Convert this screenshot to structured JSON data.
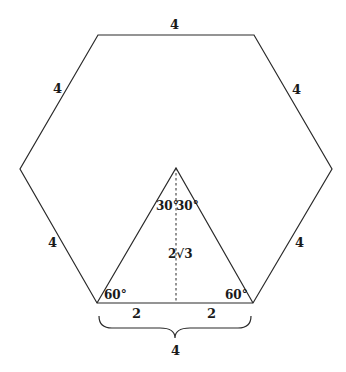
{
  "diagram": {
    "title": "",
    "shape": "regular hexagon with inscribed equilateral triangle",
    "hexagon": {
      "vertices": [
        [
          98,
          35
        ],
        [
          254,
          35
        ],
        [
          332,
          169
        ],
        [
          253,
          303
        ],
        [
          97,
          303
        ],
        [
          20,
          169
        ]
      ],
      "side_labels": [
        {
          "text": "4",
          "x": 174,
          "y": 29
        },
        {
          "text": "4",
          "x": 57,
          "y": 93
        },
        {
          "text": "4",
          "x": 296,
          "y": 94
        },
        {
          "text": "4",
          "x": 52,
          "y": 247
        },
        {
          "text": "4",
          "x": 299,
          "y": 247
        }
      ]
    },
    "triangle": {
      "vertices": [
        [
          176,
          168
        ],
        [
          97,
          303
        ],
        [
          253,
          303
        ]
      ],
      "apex_angles": [
        {
          "text": "30°",
          "x": 157,
          "y": 210
        },
        {
          "text": "30°",
          "x": 177,
          "y": 210
        }
      ],
      "base_angles": [
        {
          "text": "60°",
          "x": 104,
          "y": 299
        },
        {
          "text": "60°",
          "x": 226,
          "y": 299
        }
      ],
      "height_label": "2√3",
      "height_label_parts": {
        "coef": "2",
        "radicand": "3"
      },
      "half_base_labels": [
        {
          "text": "2",
          "x": 136,
          "y": 318
        },
        {
          "text": "2",
          "x": 211,
          "y": 318
        }
      ]
    },
    "altitude": {
      "x": 176,
      "y1": 168,
      "y2": 303,
      "style": "dashed"
    },
    "brace": {
      "x1": 99,
      "x2": 251,
      "y": 316,
      "label": "4",
      "label_x": 175,
      "label_y": 355
    }
  }
}
